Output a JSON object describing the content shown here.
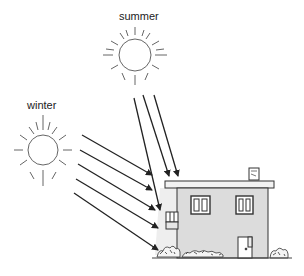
{
  "diagram": {
    "title": "",
    "labels": {
      "summer": "summer",
      "winter": "winter"
    },
    "colors": {
      "line": "#222222",
      "sun_ray": "#666666",
      "wall_fill": "#dcdcdc",
      "roof_fill": "#f2f2f2",
      "light_cone": "#eeeeee"
    },
    "nodes": [
      {
        "id": "summer-sun",
        "icon": "sun-icon",
        "label": "summer",
        "cx": 135,
        "cy": 55,
        "r": 16
      },
      {
        "id": "winter-sun",
        "icon": "sun-icon",
        "label": "winter",
        "cx": 43,
        "cy": 150,
        "r": 15
      },
      {
        "id": "house",
        "icon": "house-icon",
        "label": ""
      }
    ],
    "edges": [
      {
        "from": "summer-sun",
        "to": "house",
        "kind": "sun-ray-steep",
        "count": 3
      },
      {
        "from": "winter-sun",
        "to": "house",
        "kind": "sun-ray-low",
        "count": 5
      }
    ]
  }
}
